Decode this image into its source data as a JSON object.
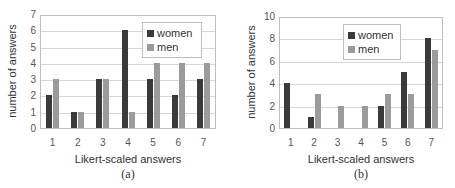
{
  "colors": {
    "women": "#3a3a3a",
    "men": "#9b9b9b"
  },
  "chart_data": [
    {
      "type": "bar",
      "title": "",
      "caption": "(a)",
      "categories": [
        "1",
        "2",
        "3",
        "4",
        "5",
        "6",
        "7"
      ],
      "series": [
        {
          "name": "women",
          "values": [
            2,
            1,
            3,
            6,
            3,
            2,
            3
          ]
        },
        {
          "name": "men",
          "values": [
            3,
            1,
            3,
            1,
            4,
            4,
            4
          ]
        }
      ],
      "xlabel": "Likert-scaled answers",
      "ylabel": "number of answers",
      "ylim": [
        0,
        7
      ],
      "yticks": [
        "0",
        "1",
        "2",
        "3",
        "4",
        "5",
        "6",
        "7"
      ],
      "grid": true,
      "legend_position": "upper right"
    },
    {
      "type": "bar",
      "title": "",
      "caption": "(b)",
      "categories": [
        "1",
        "2",
        "3",
        "4",
        "5",
        "6",
        "7"
      ],
      "series": [
        {
          "name": "women",
          "values": [
            4,
            1,
            0,
            0,
            2,
            5,
            8
          ]
        },
        {
          "name": "men",
          "values": [
            0,
            3,
            2,
            2,
            3,
            3,
            7
          ]
        }
      ],
      "xlabel": "Likert-scaled answers",
      "ylabel": "number of answers",
      "ylim": [
        0,
        10
      ],
      "yticks": [
        "0",
        "2",
        "4",
        "6",
        "8",
        "10"
      ],
      "grid": true,
      "legend_position": "upper right"
    }
  ]
}
